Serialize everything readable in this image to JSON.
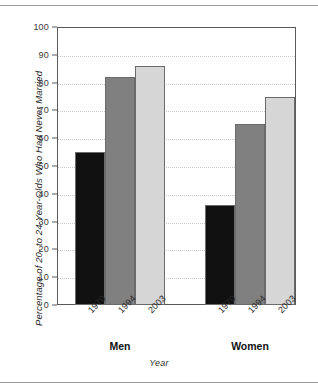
{
  "chart_data": {
    "type": "bar",
    "title": "",
    "xlabel": "Year",
    "ylabel": "Percentage of 20- to 24-Year-Olds Who Had Never Married",
    "ylim": [
      0,
      100
    ],
    "yticks": [
      0,
      10,
      20,
      30,
      40,
      50,
      60,
      70,
      80,
      90,
      100
    ],
    "ytick_labels": [
      "0",
      "10",
      "20",
      "30",
      "40",
      "50",
      "60",
      "70",
      "80",
      "90",
      "100"
    ],
    "grid": true,
    "legend": "none",
    "categories": [
      "1970",
      "1994",
      "2003"
    ],
    "groups": [
      {
        "name": "Men",
        "bars": [
          {
            "category": "1970",
            "value": 55,
            "color": "#111111"
          },
          {
            "category": "1994",
            "value": 82,
            "color": "#808080"
          },
          {
            "category": "2003",
            "value": 86,
            "color": "#d6d6d6"
          }
        ]
      },
      {
        "name": "Women",
        "bars": [
          {
            "category": "1970",
            "value": 36,
            "color": "#111111"
          },
          {
            "category": "1994",
            "value": 65,
            "color": "#808080"
          },
          {
            "category": "2003",
            "value": 75,
            "color": "#d6d6d6"
          }
        ]
      }
    ]
  },
  "colors": {
    "bar_1970": "#111111",
    "bar_1994": "#808080",
    "bar_2003": "#d6d6d6",
    "axis": "#5a5a5a",
    "grid": "#c9c9c9",
    "text": "#2b2b2b",
    "rule": "#9a9a9a",
    "background": "#ffffff"
  }
}
